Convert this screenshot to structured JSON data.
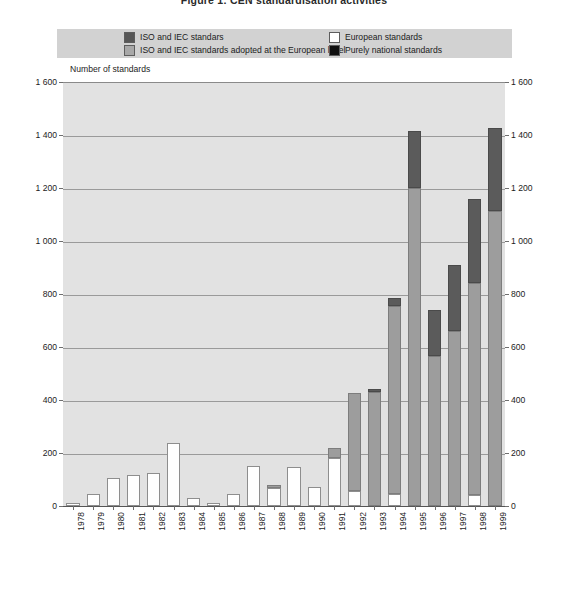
{
  "figure": {
    "title": "Figure 1:  CEN standardisation activities",
    "axis_note": "Number of standards"
  },
  "legend": {
    "items": [
      {
        "key": "iso",
        "label": "ISO and IEC standars",
        "color": "#575757"
      },
      {
        "key": "iso_eu",
        "label": "ISO and IEC standards adopted at the European level",
        "color": "#a8a8a8"
      },
      {
        "key": "eu",
        "label": "European standards",
        "color": "#ffffff"
      },
      {
        "key": "nat",
        "label": "Purely national standards",
        "color": "#101010"
      }
    ]
  },
  "axes": {
    "y_ticks": [
      "1 600",
      "1 400",
      "1 200",
      "1 000",
      "800",
      "600",
      "400",
      "200",
      "0"
    ],
    "y_min": 0,
    "y_max": 1600,
    "y_step": 200,
    "x_labels": [
      "1978",
      "1979",
      "1980",
      "1981",
      "1982",
      "1983",
      "1984",
      "1985",
      "1986",
      "1987",
      "1988",
      "1989",
      "1990",
      "1991",
      "1992",
      "1993",
      "1994",
      "1995",
      "1996",
      "1997",
      "1998",
      "1999"
    ]
  },
  "chart_data": {
    "type": "bar",
    "stacked": true,
    "title": "Figure 1:  CEN standardisation activities",
    "xlabel": "",
    "ylabel": "Number of standards",
    "ylim": [
      0,
      1600
    ],
    "ytick_step": 200,
    "grid": true,
    "legend_position": "top",
    "categories": [
      "1978",
      "1979",
      "1980",
      "1981",
      "1982",
      "1983",
      "1984",
      "1985",
      "1986",
      "1987",
      "1988",
      "1989",
      "1990",
      "1991",
      "1992",
      "1993",
      "1994",
      "1995",
      "1996",
      "1997",
      "1998",
      "1999"
    ],
    "series": [
      {
        "name": "European standards",
        "color": "#ffffff",
        "values": [
          10,
          45,
          105,
          118,
          125,
          238,
          30,
          12,
          45,
          152,
          68,
          148,
          72,
          180,
          55,
          0,
          45,
          0,
          0,
          0,
          40,
          0
        ]
      },
      {
        "name": "ISO and IEC standards adopted at the European level",
        "color": "#9d9d9d",
        "values": [
          0,
          0,
          0,
          0,
          0,
          0,
          0,
          0,
          0,
          0,
          10,
          0,
          0,
          40,
          370,
          430,
          710,
          1200,
          565,
          660,
          800,
          1115
        ]
      },
      {
        "name": "ISO and IEC standars",
        "color": "#5b5b5b",
        "values": [
          0,
          0,
          0,
          0,
          0,
          0,
          0,
          0,
          0,
          0,
          0,
          0,
          0,
          0,
          0,
          10,
          30,
          215,
          175,
          250,
          320,
          310
        ]
      },
      {
        "name": "Purely national standards",
        "color": "#111111",
        "values": [
          0,
          0,
          0,
          0,
          0,
          0,
          0,
          0,
          0,
          0,
          0,
          0,
          0,
          0,
          0,
          0,
          0,
          0,
          0,
          0,
          0,
          0
        ]
      }
    ],
    "totals": [
      10,
      45,
      105,
      118,
      125,
      238,
      30,
      12,
      45,
      152,
      78,
      148,
      72,
      220,
      425,
      440,
      785,
      1415,
      740,
      910,
      1160,
      1425
    ]
  }
}
